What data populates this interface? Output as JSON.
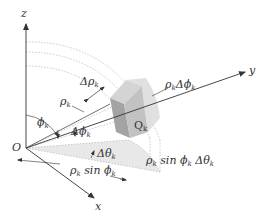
{
  "figure": {
    "colors": {
      "axis": "#333333",
      "dotted": "#b8b8b8",
      "box_light": "#d9d9d9",
      "box_mid": "#c4c4c4",
      "box_dark": "#9e9e9e",
      "wedge": "#e6e6e6"
    }
  },
  "axes": {
    "z": "z",
    "y": "y",
    "x": "x",
    "origin": "O"
  },
  "labels": {
    "delta_rho": {
      "main": "Δρ",
      "sub": "k"
    },
    "rho": {
      "main": "ρ",
      "sub": "k"
    },
    "rho_delta_phi": {
      "main1": "ρ",
      "sub1": "k",
      "main2": "Δϕ",
      "sub2": "k"
    },
    "q": {
      "main": "Q",
      "sub": "k"
    },
    "phi": {
      "main": "ϕ",
      "sub": "k"
    },
    "delta_phi": {
      "main": "Δϕ",
      "sub": "k"
    },
    "delta_theta": {
      "main": "Δθ",
      "sub": "k"
    },
    "rho_sin_phi": {
      "main1": "ρ",
      "sub1": "k",
      "mid": " sin ϕ",
      "sub2": "k"
    },
    "rho_sin_phi_delta_theta": {
      "main1": "ρ",
      "sub1": "k",
      "mid": " sin ϕ",
      "sub2": "k",
      "main3": " Δθ",
      "sub3": "k"
    }
  }
}
